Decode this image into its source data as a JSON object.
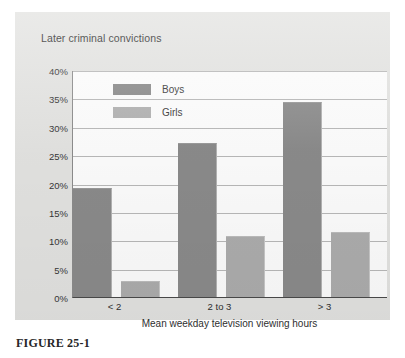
{
  "figure": {
    "caption": "FIGURE 25-1"
  },
  "chart_data": {
    "type": "bar",
    "title": "Later criminal convictions",
    "xlabel": "Mean weekday television viewing hours",
    "ylabel": "",
    "categories": [
      "< 2",
      "2 to 3",
      "> 3"
    ],
    "series": [
      {
        "name": "Boys",
        "values": [
          19.0,
          27.0,
          34.2
        ],
        "color": "#8b8b8b"
      },
      {
        "name": "Girls",
        "values": [
          2.7,
          10.5,
          11.3
        ],
        "color": "#adadad"
      }
    ],
    "ylim": [
      0,
      40
    ],
    "ytick_values": [
      0,
      5,
      10,
      15,
      20,
      25,
      30,
      35,
      40
    ],
    "ytick_labels": [
      "0%",
      "5%",
      "10%",
      "15%",
      "20%",
      "25%",
      "30%",
      "35%",
      "40%"
    ],
    "grid": true,
    "legend_position": "top-left-inside",
    "legend_entries": [
      "Boys",
      "Girls"
    ]
  },
  "colors": {
    "panel_background": "#e3e3e1",
    "plot_background": "#fdfdfd",
    "gridline": "#b9b9b9",
    "axis": "#4a4a4a",
    "boys": "#8b8b8b",
    "girls": "#adadad"
  }
}
